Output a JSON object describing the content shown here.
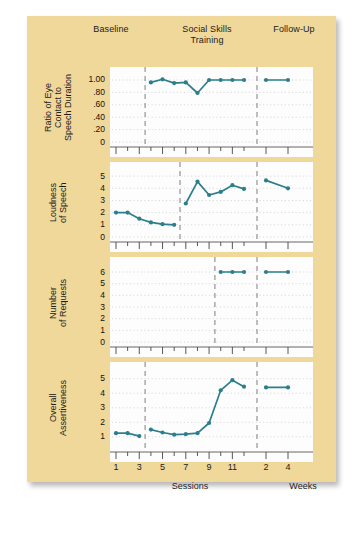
{
  "figure": {
    "background_color": "#f0d79a",
    "plot_background": "#fdfdfd",
    "series_color": "#2b7f8c",
    "phase_line_color": "#8a8a8a",
    "phases": [
      {
        "label": "Baseline"
      },
      {
        "label": "Social Skills\nTraining"
      },
      {
        "label": "Follow-Up"
      }
    ],
    "phase_labels": {
      "baseline": "Baseline",
      "training_line1": "Social Skills",
      "training_line2": "Training",
      "followup": "Follow-Up"
    },
    "x_caption_sessions": "Sessions",
    "x_caption_weeks": "Weeks"
  },
  "chart_data": {
    "type": "line",
    "title": "",
    "xlabel": "Sessions",
    "ylabel": "",
    "grid": true,
    "legend": null,
    "design": "multiple-baseline across behaviors",
    "x_sessions": [
      1,
      2,
      3,
      4,
      5,
      6,
      7,
      8,
      9,
      10,
      11,
      12
    ],
    "x_session_ticklabels": [
      "1",
      "",
      "3",
      "",
      "5",
      "",
      "7",
      "",
      "9",
      "",
      "11",
      ""
    ],
    "x_weeks": [
      2,
      4
    ],
    "x_week_ticklabels": [
      "2",
      "4"
    ],
    "panels": [
      {
        "id": "eye-contact",
        "ylabel_lines": [
          "Ratio of Eye",
          "Contact to",
          "Speech Duration"
        ],
        "ylabel": "Ratio of Eye Contact to Speech Duration",
        "yticks": [
          0,
          0.2,
          0.4,
          0.6,
          0.8,
          1.0
        ],
        "yticklabels": [
          "0",
          ".20",
          ".40",
          ".60",
          ".80",
          "1.00"
        ],
        "ylim": [
          0,
          1.08
        ],
        "phase_change_session": 3.5,
        "baseline_values": [],
        "baseline_x": [],
        "treatment_x": [
          4,
          5,
          6,
          7,
          8,
          9,
          10,
          11,
          12
        ],
        "treatment_values": [
          0.96,
          1.01,
          0.95,
          0.96,
          0.79,
          1.0,
          1.0,
          1.0,
          1.0
        ],
        "followup_x": [
          2,
          4
        ],
        "followup_values": [
          1.0,
          1.0
        ]
      },
      {
        "id": "loudness",
        "ylabel_lines": [
          "Loudness",
          "of Speech"
        ],
        "ylabel": "Loudness of Speech",
        "yticks": [
          0,
          1,
          2,
          3,
          4,
          5
        ],
        "yticklabels": [
          "0",
          "1",
          "2",
          "3",
          "4",
          "5"
        ],
        "ylim": [
          0,
          5.5
        ],
        "phase_change_session": 6.5,
        "baseline_x": [
          1,
          2,
          3,
          4,
          5,
          6
        ],
        "baseline_values": [
          2.0,
          2.0,
          1.5,
          1.2,
          1.05,
          1.0
        ],
        "treatment_x": [
          7,
          8,
          9,
          10,
          11,
          12
        ],
        "treatment_values": [
          2.75,
          4.55,
          3.45,
          3.7,
          4.25,
          3.95
        ],
        "followup_x": [
          2,
          4
        ],
        "followup_values": [
          4.65,
          4.0
        ]
      },
      {
        "id": "requests",
        "ylabel_lines": [
          "Number",
          "of Requests"
        ],
        "ylabel": "Number of Requests",
        "yticks": [
          0,
          1,
          2,
          3,
          4,
          5,
          6
        ],
        "yticklabels": [
          "0",
          "1",
          "2",
          "3",
          "4",
          "5",
          "6"
        ],
        "ylim": [
          0,
          6.6
        ],
        "phase_change_session": 9.5,
        "baseline_x": [],
        "baseline_values": [],
        "treatment_x": [
          10,
          11,
          12
        ],
        "treatment_values": [
          6.0,
          6.0,
          6.0
        ],
        "followup_x": [
          2,
          4
        ],
        "followup_values": [
          6.0,
          6.0
        ]
      },
      {
        "id": "assertiveness",
        "ylabel_lines": [
          "Overall",
          "Assertiveness"
        ],
        "ylabel": "Overall Assertiveness",
        "yticks": [
          1,
          2,
          3,
          4,
          5
        ],
        "yticklabels": [
          "1",
          "2",
          "3",
          "4",
          "5"
        ],
        "ylim": [
          0.3,
          5.6
        ],
        "phase_change_session": 3.5,
        "baseline_x": [
          1,
          2,
          3
        ],
        "baseline_values": [
          1.25,
          1.25,
          1.05
        ],
        "treatment_x": [
          4,
          5,
          6,
          7,
          8,
          9,
          10,
          11,
          12
        ],
        "treatment_values": [
          1.5,
          1.3,
          1.15,
          1.18,
          1.25,
          1.95,
          4.2,
          4.9,
          4.45
        ],
        "followup_x": [
          2,
          4
        ],
        "followup_values": [
          4.4,
          4.4
        ]
      }
    ],
    "followup_divider_after_session": 12.5
  }
}
